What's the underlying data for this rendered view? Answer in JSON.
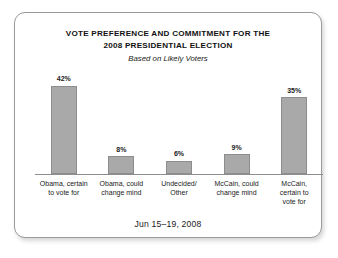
{
  "chart_data": {
    "type": "bar",
    "title": "VOTE PREFERENCE AND COMMITMENT FOR THE 2008 PRESIDENTIAL ELECTION",
    "title_lines": [
      "VOTE PREFERENCE AND COMMITMENT FOR THE",
      "2008 PRESIDENTIAL ELECTION"
    ],
    "subtitle": "Based on Likely Voters",
    "footer": "Jun 15–19, 2008",
    "xlabel": "",
    "ylabel": "",
    "ylim": [
      0,
      45
    ],
    "grid": false,
    "legend": "none",
    "value_suffix": "%",
    "categories": [
      "Obama, certain to vote for",
      "Obama, could change mind",
      "Undecided/ Other",
      "McCain, could change mind",
      "McCain, certain to vote for"
    ],
    "category_lines": [
      [
        "Obama, certain",
        "to vote for"
      ],
      [
        "Obama, could",
        "change mind"
      ],
      [
        "Undecided/",
        "Other"
      ],
      [
        "McCain, could",
        "change mind"
      ],
      [
        "McCain,",
        "certain to",
        "vote for"
      ]
    ],
    "values": [
      42,
      8,
      6,
      9,
      35
    ],
    "value_labels": [
      "42%",
      "8%",
      "6%",
      "9%",
      "35%"
    ],
    "bar_fill": "#a9a9a9",
    "bar_stroke": "#8d8d8d",
    "axis_color": "#8c8c8c",
    "text_color": "#1a1a1a",
    "card_border": "#9a9a9a",
    "background": "#ffffff"
  }
}
